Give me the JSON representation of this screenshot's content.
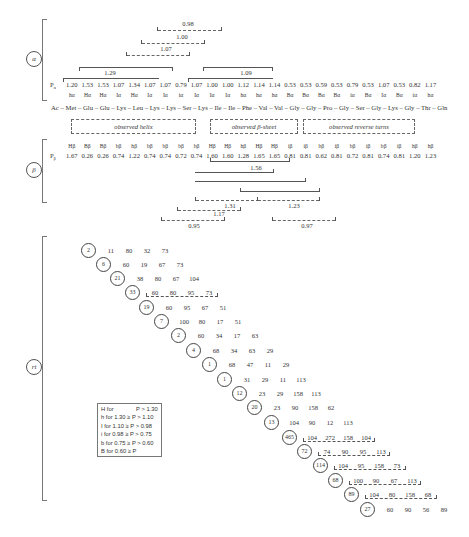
{
  "sections": {
    "alpha": {
      "label": "α"
    },
    "beta": {
      "label": "β"
    },
    "turn": {
      "label": "rt"
    }
  },
  "alpha": {
    "row_label": "Pα",
    "values": [
      "1.20",
      "1.53",
      "1.53",
      "1.07",
      "1.34",
      "1.07",
      "1.07",
      "0.79",
      "1.07",
      "1.00",
      "1.00",
      "1.12",
      "1.14",
      "1.14",
      "0.53",
      "0.53",
      "0.59",
      "0.53",
      "0.79",
      "0.53",
      "1.07",
      "0.53",
      "0.82",
      "1.17"
    ],
    "conformations": [
      "hα",
      "Hα",
      "Hα",
      "Iα",
      "Hα",
      "Iα",
      "Iα",
      "iα",
      "Iα",
      "Iα",
      "Iα",
      "hα",
      "hα",
      "hα",
      "Bα",
      "Bα",
      "Bα",
      "Bα",
      "iα",
      "Bα",
      "Iα",
      "Bα",
      "iα",
      "hα"
    ],
    "brackets": [
      {
        "label": "0.98",
        "style": "dash"
      },
      {
        "label": "1.00",
        "style": "dashdot"
      },
      {
        "label": "1.07",
        "style": "dashdot"
      },
      {
        "label": "1.29",
        "style": "solid"
      },
      {
        "label": "1.09",
        "style": "solid"
      }
    ]
  },
  "sequence": {
    "text": "Ac – Met – Glu – Glu – Lys – Leu – Lys – Lys – Ser – Lys – Ile – Ile – Phe – Val – Val – Gly – Gly – Pro – Gly – Ser – Gly – Lys – Gly – Thr – Gln"
  },
  "observed": {
    "helix": "observed helix",
    "sheet": "observed β-sheet",
    "turns": "observed reverse turns"
  },
  "beta": {
    "row_label": "Pβ",
    "values": [
      "1.67",
      "0.26",
      "0.26",
      "0.74",
      "1.22",
      "0.74",
      "0.74",
      "0.72",
      "0.74",
      "1.60",
      "1.60",
      "1.28",
      "1.65",
      "1.65",
      "0.81",
      "0.81",
      "0.62",
      "0.81",
      "0.72",
      "0.81",
      "0.74",
      "0.81",
      "1.20",
      "1.23"
    ],
    "conformations": [
      "Hβ",
      "Bβ",
      "Bβ",
      "bβ",
      "hβ",
      "bβ",
      "bβ",
      "bβ",
      "bβ",
      "Hβ",
      "Hβ",
      "hβ",
      "Hβ",
      "Hβ",
      "iβ",
      "iβ",
      "bβ",
      "iβ",
      "bβ",
      "iβ",
      "bβ",
      "iβ",
      "hβ",
      "hβ"
    ],
    "brackets": [
      {
        "label": "1.56",
        "style": "solid"
      },
      {
        "label": "",
        "style": "solid"
      },
      {
        "label": "",
        "style": "solid"
      },
      {
        "label": "1.31",
        "style": "dashdot"
      },
      {
        "label": "1.23",
        "style": "dashdot"
      },
      {
        "label": "1.17",
        "style": "dash"
      },
      {
        "label": "0.95",
        "style": "dash"
      },
      {
        "label": "0.97",
        "style": "dash"
      }
    ]
  },
  "turns": {
    "rows": [
      {
        "circ": "2",
        "vals": [
          "11",
          "80",
          "32",
          "73"
        ],
        "marked": false
      },
      {
        "circ": "6",
        "vals": [
          "60",
          "19",
          "67",
          "73"
        ],
        "marked": false
      },
      {
        "circ": "21",
        "vals": [
          "38",
          "80",
          "67",
          "104"
        ],
        "marked": false
      },
      {
        "circ": "33",
        "vals": [
          "60",
          "80",
          "95",
          "73"
        ],
        "marked": true
      },
      {
        "circ": "19",
        "vals": [
          "60",
          "95",
          "67",
          "51"
        ],
        "marked": false
      },
      {
        "circ": "7",
        "vals": [
          "100",
          "80",
          "17",
          "51"
        ],
        "marked": false
      },
      {
        "circ": "2",
        "vals": [
          "60",
          "34",
          "17",
          "63"
        ],
        "marked": false
      },
      {
        "circ": "4",
        "vals": [
          "68",
          "34",
          "63",
          "29"
        ],
        "marked": false
      },
      {
        "circ": "1",
        "vals": [
          "68",
          "47",
          "11",
          "29"
        ],
        "marked": false
      },
      {
        "circ": "1",
        "vals": [
          "31",
          "29",
          "11",
          "113"
        ],
        "marked": false
      },
      {
        "circ": "12",
        "vals": [
          "23",
          "29",
          "158",
          "113"
        ],
        "marked": false
      },
      {
        "circ": "20",
        "vals": [
          "23",
          "90",
          "158",
          "62"
        ],
        "marked": false
      },
      {
        "circ": "13",
        "vals": [
          "104",
          "90",
          "12",
          "113"
        ],
        "marked": false
      },
      {
        "circ": "465",
        "vals": [
          "104",
          "272",
          "158",
          "104"
        ],
        "marked": true
      },
      {
        "circ": "72",
        "vals": [
          "74",
          "90",
          "95",
          "113"
        ],
        "marked": true
      },
      {
        "circ": "114",
        "vals": [
          "104",
          "95",
          "158",
          "73"
        ],
        "marked": true
      },
      {
        "circ": "68",
        "vals": [
          "100",
          "90",
          "67",
          "113"
        ],
        "marked": true
      },
      {
        "circ": "89",
        "vals": [
          "104",
          "80",
          "158",
          "68"
        ],
        "marked": true
      },
      {
        "circ": "27",
        "vals": [
          "60",
          "90",
          "56",
          "89"
        ],
        "marked": false
      }
    ]
  },
  "legend": {
    "items": [
      "H for              P > 1.30",
      "h for 1.30 ≥ P > 1.10",
      "I for 1.10 ≥ P > 0.98",
      "i for 0.98 ≥ P > 0.75",
      "b for 0.75 ≥ P > 0.60",
      "B for 0.60 ≥ P"
    ]
  }
}
